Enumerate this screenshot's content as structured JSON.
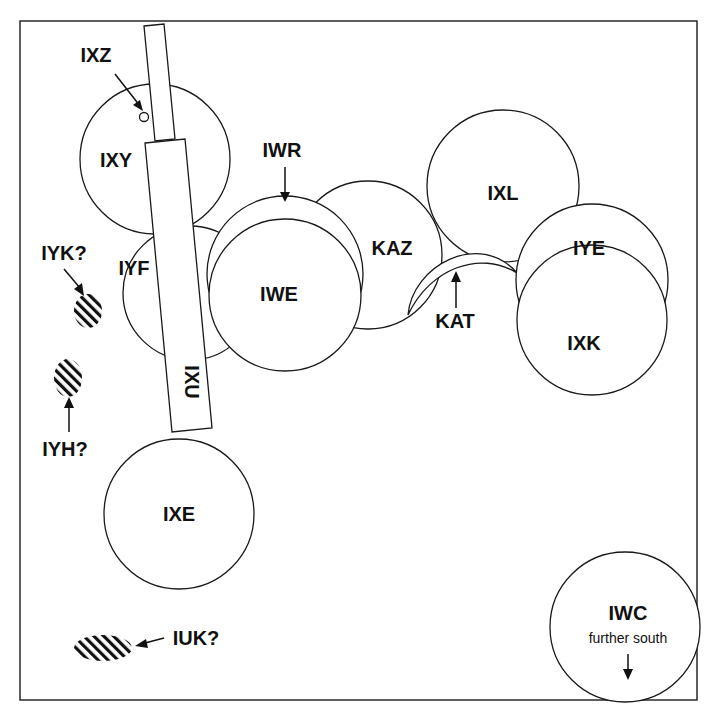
{
  "diagram": {
    "type": "site-plan",
    "colors": {
      "line": "#1a1a1a",
      "text": "#111111",
      "background": "#ffffff"
    },
    "features": [
      {
        "id": "IXZ",
        "label": "IXZ",
        "shape": "small-circle",
        "pointer": "arrow"
      },
      {
        "id": "IXY",
        "label": "IXY",
        "shape": "circle"
      },
      {
        "id": "IWR",
        "label": "IWR",
        "shape": "crescent",
        "pointer": "arrow"
      },
      {
        "id": "IXL",
        "label": "IXL",
        "shape": "circle"
      },
      {
        "id": "KAZ",
        "label": "KAZ",
        "shape": "circle"
      },
      {
        "id": "IYE",
        "label": "IYE",
        "shape": "circle"
      },
      {
        "id": "IYF",
        "label": "IYF",
        "shape": "circle"
      },
      {
        "id": "IWE",
        "label": "IWE",
        "shape": "circle"
      },
      {
        "id": "KAT",
        "label": "KAT",
        "shape": "crescent",
        "pointer": "arrow"
      },
      {
        "id": "IXK",
        "label": "IXK",
        "shape": "circle"
      },
      {
        "id": "IYK",
        "label": "IYK?",
        "shape": "hatched-oval",
        "pointer": "arrow"
      },
      {
        "id": "IYH",
        "label": "IYH?",
        "shape": "hatched-oval",
        "pointer": "arrow"
      },
      {
        "id": "IXU",
        "label": "IXU",
        "shape": "trench-rectangle"
      },
      {
        "id": "IXE",
        "label": "IXE",
        "shape": "circle"
      },
      {
        "id": "IUK",
        "label": "IUK?",
        "shape": "hatched-oval",
        "pointer": "arrow"
      },
      {
        "id": "IWC",
        "label": "IWC",
        "note": "further south",
        "shape": "circle",
        "pointer": "arrow-down"
      }
    ]
  }
}
